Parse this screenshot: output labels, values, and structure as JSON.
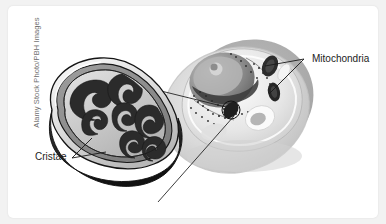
{
  "figure": {
    "kind": "biology-diagram",
    "background_color": "#f2f2f2",
    "card_color": "#ffffff"
  },
  "watermark": {
    "text": "Alamy Stock Photo/PBH Images",
    "orientation": "vertical",
    "color": "#6e6e6e"
  },
  "labels": {
    "mitochondria": "Mitochondria",
    "cristae": "Cristae",
    "color": "#1c1c1c"
  },
  "callouts": [
    {
      "name": "mitochondria-callout",
      "label": "Mitochondria",
      "targets": 2
    },
    {
      "name": "cristae-callout",
      "label": "Cristae",
      "targets": 2
    },
    {
      "name": "magnification-cone",
      "label": "",
      "targets": 1
    }
  ],
  "cell": {
    "name": "animal-cell",
    "structures": [
      "nucleus",
      "nucleolus",
      "cytoplasm",
      "mitochondria",
      "endoplasmic-reticulum",
      "vacuole",
      "ribosomes"
    ],
    "palette": {
      "membrane": "#d8d8d8",
      "cytoplasm": "#cfcfcf",
      "nucleus": "#8f8f8f",
      "nucleolus": "#b9b9b9",
      "dark_organelle": "#3a3a3a"
    }
  },
  "mitochondrion": {
    "name": "magnified-mitochondrion",
    "parts": [
      "outer-membrane",
      "inner-membrane",
      "cristae",
      "matrix"
    ],
    "cristae_count": 7,
    "palette": {
      "outer": "#e9e9e9",
      "inner": "#9a9a9a",
      "matrix": "#cccccc",
      "cristae": "#2e2e2e",
      "shadow": "#1e1e1e",
      "outline": "#111111"
    }
  }
}
